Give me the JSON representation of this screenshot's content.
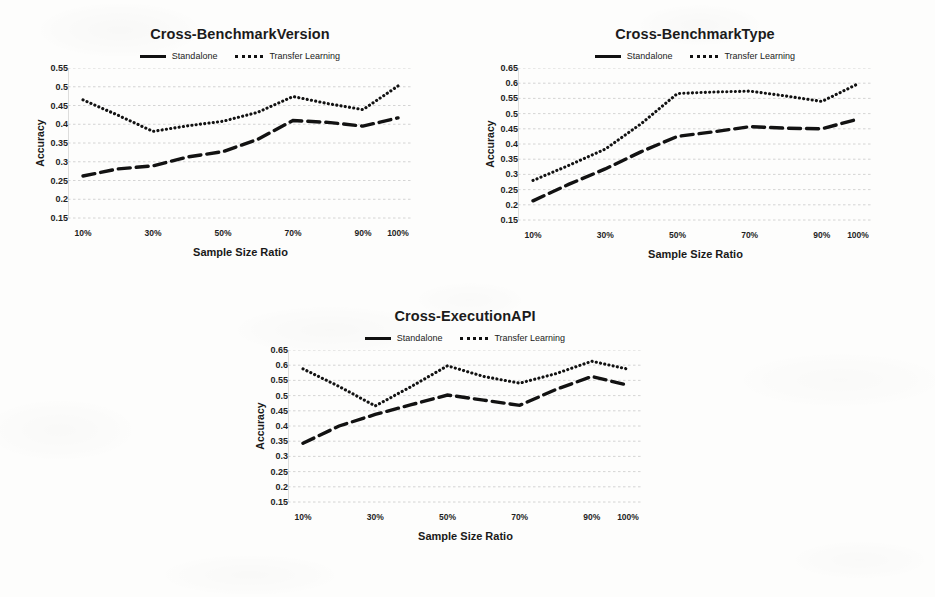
{
  "figure": {
    "series_names": [
      "Standalone",
      "Transfer Learning"
    ],
    "xlabel": "Sample Size Ratio",
    "ylabel": "Accuracy",
    "legend_standalone": "Standalone",
    "legend_transfer": "Transfer Learning"
  },
  "chart_data": [
    {
      "type": "line",
      "title": "Cross-BenchmarkVersion",
      "xlabel": "Sample Size Ratio",
      "ylabel": "Accuracy",
      "x": [
        "10%",
        "20%",
        "30%",
        "40%",
        "50%",
        "60%",
        "70%",
        "80%",
        "90%",
        "100%"
      ],
      "xtick_labels": [
        "10%",
        "30%",
        "50%",
        "70%",
        "90%",
        "100%"
      ],
      "xtick_positions": [
        0,
        2,
        4,
        6,
        8,
        9
      ],
      "ytick_labels": [
        "0.15",
        "0.2",
        "0.25",
        "0.3",
        "0.35",
        "0.4",
        "0.45",
        "0.5",
        "0.55"
      ],
      "ylim": [
        0.15,
        0.55
      ],
      "ystep": 0.05,
      "grid": true,
      "legend_position": "top-center",
      "series": [
        {
          "name": "Standalone",
          "style": "dashed",
          "values": [
            0.262,
            0.281,
            0.289,
            0.313,
            0.327,
            0.36,
            0.41,
            0.405,
            0.395,
            0.417
          ]
        },
        {
          "name": "Transfer Learning",
          "style": "dotted",
          "values": [
            0.465,
            0.424,
            0.381,
            0.396,
            0.408,
            0.432,
            0.474,
            0.455,
            0.439,
            0.502
          ]
        }
      ]
    },
    {
      "type": "line",
      "title": "Cross-BenchmarkType",
      "xlabel": "Sample Size Ratio",
      "ylabel": "Accuracy",
      "x": [
        "10%",
        "20%",
        "30%",
        "40%",
        "50%",
        "60%",
        "70%",
        "80%",
        "90%",
        "100%"
      ],
      "xtick_labels": [
        "10%",
        "30%",
        "50%",
        "70%",
        "90%",
        "100%"
      ],
      "xtick_positions": [
        0,
        2,
        4,
        6,
        8,
        9
      ],
      "ytick_labels": [
        "0.15",
        "0.2",
        "0.25",
        "0.3",
        "0.35",
        "0.4",
        "0.45",
        "0.5",
        "0.55",
        "0.6",
        "0.65"
      ],
      "ylim": [
        0.15,
        0.65
      ],
      "ystep": 0.05,
      "grid": true,
      "legend_position": "top-center",
      "series": [
        {
          "name": "Standalone",
          "style": "dashed",
          "values": [
            0.213,
            0.268,
            0.318,
            0.375,
            0.425,
            0.44,
            0.457,
            0.452,
            0.45,
            0.482
          ]
        },
        {
          "name": "Transfer Learning",
          "style": "dotted",
          "values": [
            0.28,
            0.33,
            0.383,
            0.467,
            0.566,
            0.571,
            0.574,
            0.558,
            0.54,
            0.598
          ]
        }
      ]
    },
    {
      "type": "line",
      "title": "Cross-ExecutionAPI",
      "xlabel": "Sample Size Ratio",
      "ylabel": "Accuracy",
      "x": [
        "10%",
        "20%",
        "30%",
        "40%",
        "50%",
        "60%",
        "70%",
        "80%",
        "90%",
        "100%"
      ],
      "xtick_labels": [
        "10%",
        "30%",
        "50%",
        "70%",
        "90%",
        "100%"
      ],
      "xtick_positions": [
        0,
        2,
        4,
        6,
        8,
        9
      ],
      "ytick_labels": [
        "0.15",
        "0.2",
        "0.25",
        "0.3",
        "0.35",
        "0.4",
        "0.45",
        "0.5",
        "0.55",
        "0.6",
        "0.65"
      ],
      "ylim": [
        0.15,
        0.65
      ],
      "ystep": 0.05,
      "grid": true,
      "legend_position": "top-center",
      "series": [
        {
          "name": "Standalone",
          "style": "dashed",
          "values": [
            0.343,
            0.4,
            0.438,
            0.47,
            0.502,
            0.485,
            0.468,
            0.52,
            0.563,
            0.534
          ]
        },
        {
          "name": "Transfer Learning",
          "style": "dotted",
          "values": [
            0.588,
            0.53,
            0.466,
            0.53,
            0.598,
            0.563,
            0.541,
            0.572,
            0.613,
            0.587
          ]
        }
      ]
    }
  ]
}
